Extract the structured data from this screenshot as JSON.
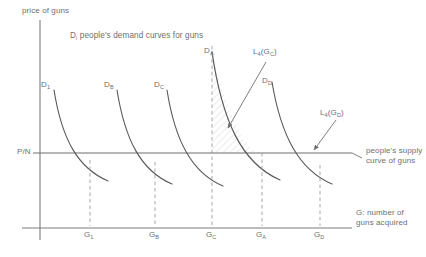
{
  "figure": {
    "type": "economics-diagram",
    "axes": {
      "y_label": "price of guns",
      "x_label_line1": "G: number of",
      "x_label_line2": "guns acquired",
      "y_tick_label": "P/N"
    },
    "title": "D",
    "title_sub": "i",
    "title_rest": " people's demand curves for guns",
    "demand_curves": [
      {
        "label": "D",
        "sub": "1",
        "name": "demand-curve-1"
      },
      {
        "label": "D",
        "sub": "B",
        "name": "demand-curve-b"
      },
      {
        "label": "D",
        "sub": "C",
        "name": "demand-curve-c"
      },
      {
        "label": "D",
        "sub": "A",
        "name": "demand-curve-a"
      },
      {
        "label": "D",
        "sub": "D",
        "name": "demand-curve-d"
      }
    ],
    "x_ticks": [
      {
        "label": "G",
        "sub": "1"
      },
      {
        "label": "G",
        "sub": "B"
      },
      {
        "label": "G",
        "sub": "C"
      },
      {
        "label": "G",
        "sub": "A"
      },
      {
        "label": "G",
        "sub": "D"
      }
    ],
    "annotations": [
      {
        "name": "loss-label-gc",
        "text": "L",
        "sub": "4",
        "arg": "(G",
        "arg_sub": "C",
        "arg_close": ")"
      },
      {
        "name": "loss-label-gd",
        "text": "L",
        "sub": "4",
        "arg": "(G",
        "arg_sub": "D",
        "arg_close": ")"
      }
    ],
    "supply_label_line1": "people's supply",
    "supply_label_line2": "curve of guns",
    "colors": {
      "ink": "#6d6f72",
      "curve": "#58585a",
      "axis": "#7a7c7e",
      "dashed": "#9a9c9e",
      "hatch": "#b9bbbd",
      "background": "#ffffff"
    }
  }
}
